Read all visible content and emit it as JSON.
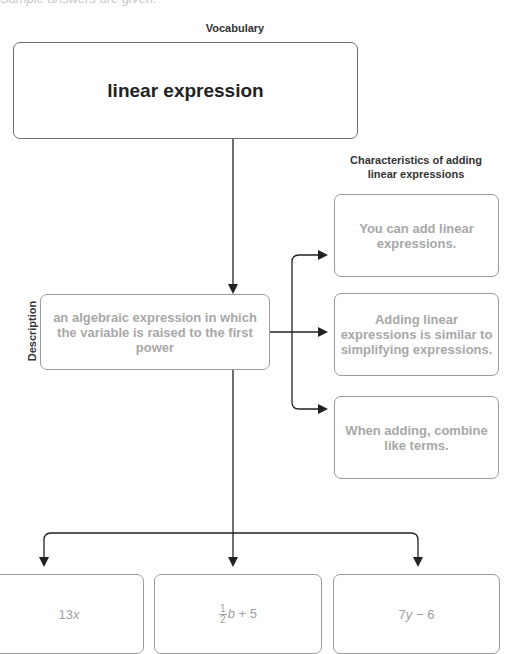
{
  "header": {
    "partial_text": "Sample answers are given."
  },
  "vocabulary": {
    "heading": "Vocabulary",
    "term": "linear expression"
  },
  "description": {
    "side_label": "Description",
    "text": "an algebraic expression in which the variable is raised to the first power"
  },
  "characteristics": {
    "heading": "Characteristics of adding linear expressions",
    "items": [
      {
        "text": "You can add linear expressions."
      },
      {
        "text": "Adding linear expressions is similar to simplifying expressions."
      },
      {
        "text": "When adding, combine like terms."
      }
    ]
  },
  "examples": [
    {
      "coef": "13",
      "var": "x"
    },
    {
      "frac_num": "1",
      "frac_den": "2",
      "var": "b",
      "rest": " + 5"
    },
    {
      "coef": "7",
      "var": "y",
      "rest": " − 6"
    }
  ],
  "colors": {
    "line": "#222222",
    "box_border": "#6e6e6e",
    "answer_text": "#a8a8a8"
  }
}
